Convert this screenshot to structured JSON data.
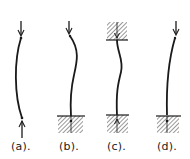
{
  "figure": {
    "colors": {
      "ink": "#1a1a1a",
      "hatch": "#444444",
      "background": "#ffffff"
    },
    "columns": [
      {
        "id": "a",
        "label": "(a).",
        "top_support": "pinned (load arrow)",
        "bottom_support": "pinned (load arrow)",
        "shape": "single bow"
      },
      {
        "id": "b",
        "label": "(b).",
        "top_support": "free (load arrow)",
        "bottom_support": "fixed (hatched block)",
        "shape": "S-curve"
      },
      {
        "id": "c",
        "label": "(c).",
        "top_support": "fixed (hatched block)",
        "bottom_support": "fixed (hatched block)",
        "shape": "S-curve"
      },
      {
        "id": "d",
        "label": "(d).",
        "top_support": "free (load arrow)",
        "bottom_support": "fixed (hatched block)",
        "shape": "cantilever curve"
      }
    ]
  }
}
